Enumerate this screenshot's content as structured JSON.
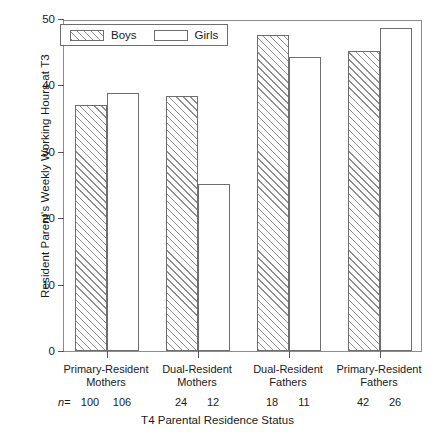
{
  "chart_data": {
    "type": "bar",
    "title": "",
    "xlabel": "T4 Parental Residence Status",
    "ylabel": "Resident Parent's Weekly Working Hours at T3",
    "ylim": [
      0,
      50
    ],
    "yticks": [
      0,
      10,
      20,
      30,
      40,
      50
    ],
    "ytick_labels": [
      "0",
      "10",
      "20",
      "30",
      "40",
      "50"
    ],
    "grid": false,
    "legend_position": "top-left",
    "categories": [
      "Primary-Resident Mothers",
      "Dual-Resident Mothers",
      "Dual-Resident Fathers",
      "Primary-Resident Fathers"
    ],
    "category_lines": [
      [
        "Primary-Resident",
        "Mothers"
      ],
      [
        "Dual-Resident",
        "Mothers"
      ],
      [
        "Dual-Resident",
        "Fathers"
      ],
      [
        "Primary-Resident",
        "Fathers"
      ]
    ],
    "series": [
      {
        "name": "Boys",
        "values": [
          37.0,
          38.4,
          47.6,
          45.2
        ],
        "fill": "hatched"
      },
      {
        "name": "Girls",
        "values": [
          38.8,
          25.2,
          44.3,
          48.7
        ],
        "fill": "white"
      }
    ],
    "sample_sizes": {
      "prefix": "n",
      "equals": "=",
      "boys": [
        "100",
        "24",
        "18",
        "42"
      ],
      "girls": [
        "106",
        "12",
        "11",
        "26"
      ]
    },
    "legend": [
      {
        "label": "Boys",
        "swatch": "hatched-swatch"
      },
      {
        "label": "Girls",
        "swatch": "white-swatch"
      }
    ]
  }
}
